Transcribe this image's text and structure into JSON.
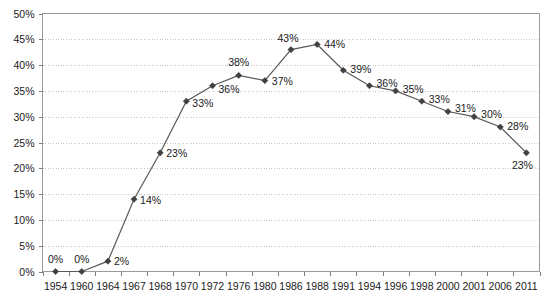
{
  "chart_data": {
    "type": "line",
    "title": "",
    "subtitle": "",
    "xlabel": "",
    "ylabel": "",
    "ylim": [
      0,
      50
    ],
    "grid": true,
    "legend": false,
    "value_suffix": "%",
    "categories": [
      "1954",
      "1960",
      "1964",
      "1967",
      "1968",
      "1970",
      "1972",
      "1976",
      "1980",
      "1986",
      "1988",
      "1991",
      "1994",
      "1996",
      "1998",
      "2000",
      "2001",
      "2006",
      "2011"
    ],
    "values": [
      0,
      0,
      2,
      14,
      23,
      33,
      36,
      38,
      37,
      43,
      44,
      39,
      36,
      35,
      33,
      31,
      30,
      28,
      23
    ],
    "data_labels": [
      "0%",
      "0%",
      "2%",
      "14%",
      "23%",
      "33%",
      "36%",
      "38%",
      "37%",
      "43%",
      "44%",
      "39%",
      "36%",
      "35%",
      "33%",
      "31%",
      "30%",
      "28%",
      "23%"
    ],
    "y_ticks": [
      0,
      5,
      10,
      15,
      20,
      25,
      30,
      35,
      40,
      45,
      50
    ],
    "y_tick_labels": [
      "0%",
      "5%",
      "10%",
      "15%",
      "20%",
      "25%",
      "30%",
      "35%",
      "40%",
      "45%",
      "50%"
    ],
    "series": [
      {
        "name": "series-1",
        "color": "#595959",
        "marker": "diamond",
        "values": [
          0,
          0,
          2,
          14,
          23,
          33,
          36,
          38,
          37,
          43,
          44,
          39,
          36,
          35,
          33,
          31,
          30,
          28,
          23
        ]
      }
    ],
    "label_offsets": [
      {
        "dx": 0,
        "dy": -9,
        "anchor": "middle"
      },
      {
        "dx": 0,
        "dy": -9,
        "anchor": "middle"
      },
      {
        "dx": 6,
        "dy": 4,
        "anchor": "start"
      },
      {
        "dx": 6,
        "dy": 5,
        "anchor": "start"
      },
      {
        "dx": 6,
        "dy": 4,
        "anchor": "start"
      },
      {
        "dx": 6,
        "dy": 6,
        "anchor": "start"
      },
      {
        "dx": 6,
        "dy": 7,
        "anchor": "start"
      },
      {
        "dx": 0,
        "dy": -9,
        "anchor": "middle"
      },
      {
        "dx": 7,
        "dy": 4,
        "anchor": "start"
      },
      {
        "dx": -3,
        "dy": -8,
        "anchor": "middle"
      },
      {
        "dx": 7,
        "dy": 4,
        "anchor": "start"
      },
      {
        "dx": 7,
        "dy": 3,
        "anchor": "start"
      },
      {
        "dx": 7,
        "dy": 1,
        "anchor": "start"
      },
      {
        "dx": 7,
        "dy": 2,
        "anchor": "start"
      },
      {
        "dx": 7,
        "dy": 2,
        "anchor": "start"
      },
      {
        "dx": 7,
        "dy": 0,
        "anchor": "start"
      },
      {
        "dx": 7,
        "dy": 1,
        "anchor": "start"
      },
      {
        "dx": 7,
        "dy": 3,
        "anchor": "start"
      },
      {
        "dx": -4,
        "dy": 16,
        "anchor": "middle"
      }
    ],
    "colors": {
      "line": "#595959",
      "marker": "#404040",
      "gridline": "#c8c8c8",
      "axis": "#808080",
      "text": "#1a1a1a",
      "background": "#ffffff"
    }
  }
}
